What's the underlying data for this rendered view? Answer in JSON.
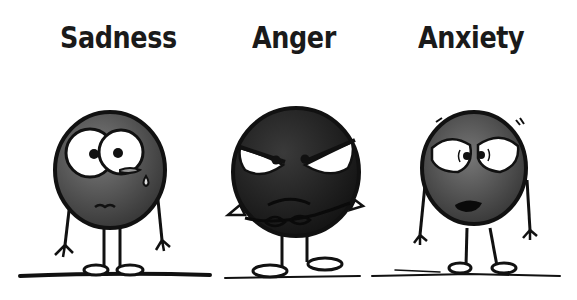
{
  "characters": [
    {
      "name": "sadness",
      "label": "Sadness",
      "tone": "#5e5e5e"
    },
    {
      "name": "anger",
      "label": "Anger",
      "tone": "#262626"
    },
    {
      "name": "anxiety",
      "label": "Anxiety",
      "tone": "#555555"
    }
  ],
  "colors": {
    "ink": "#111111",
    "background": "#ffffff",
    "eye": "#ffffff"
  }
}
